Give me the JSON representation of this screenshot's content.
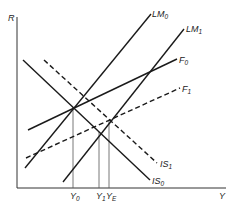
{
  "diagram": {
    "type": "IS-LM-F macroeconomic diagram",
    "axes": {
      "y_label": "R",
      "x_label": "Y"
    },
    "curves": [
      {
        "id": "IS0",
        "label": "IS",
        "sub": "0",
        "style": "solid",
        "x1": 23,
        "y1": 60,
        "x2": 150,
        "y2": 180
      },
      {
        "id": "IS1",
        "label": "IS",
        "sub": "1",
        "style": "dashed",
        "x1": 44,
        "y1": 60,
        "x2": 157,
        "y2": 163
      },
      {
        "id": "LM0",
        "label": "LM",
        "sub": "0",
        "style": "solid",
        "x1": 25,
        "y1": 168,
        "x2": 151,
        "y2": 14
      },
      {
        "id": "LM1",
        "label": "LM",
        "sub": "1",
        "style": "solid",
        "x1": 63,
        "y1": 182,
        "x2": 184,
        "y2": 29
      },
      {
        "id": "F0",
        "label": "F",
        "sub": "0",
        "style": "solid",
        "x1": 28,
        "y1": 130,
        "x2": 177,
        "y2": 59
      },
      {
        "id": "F1",
        "label": "F",
        "sub": "1",
        "style": "dashed",
        "x1": 26,
        "y1": 158,
        "x2": 180,
        "y2": 88
      }
    ],
    "x_markers": [
      {
        "id": "Y0",
        "label": "Y",
        "sub": "0",
        "x": 73,
        "y_top": 107
      },
      {
        "id": "Y1",
        "label": "Y",
        "sub": "1",
        "x": 99,
        "y_top": 132
      },
      {
        "id": "YE",
        "label": "Y",
        "sub": "E",
        "x": 109,
        "y_top": 121
      }
    ],
    "colors": {
      "line": "#1a1a1a",
      "guide": "#555555",
      "background": "#ffffff"
    }
  }
}
